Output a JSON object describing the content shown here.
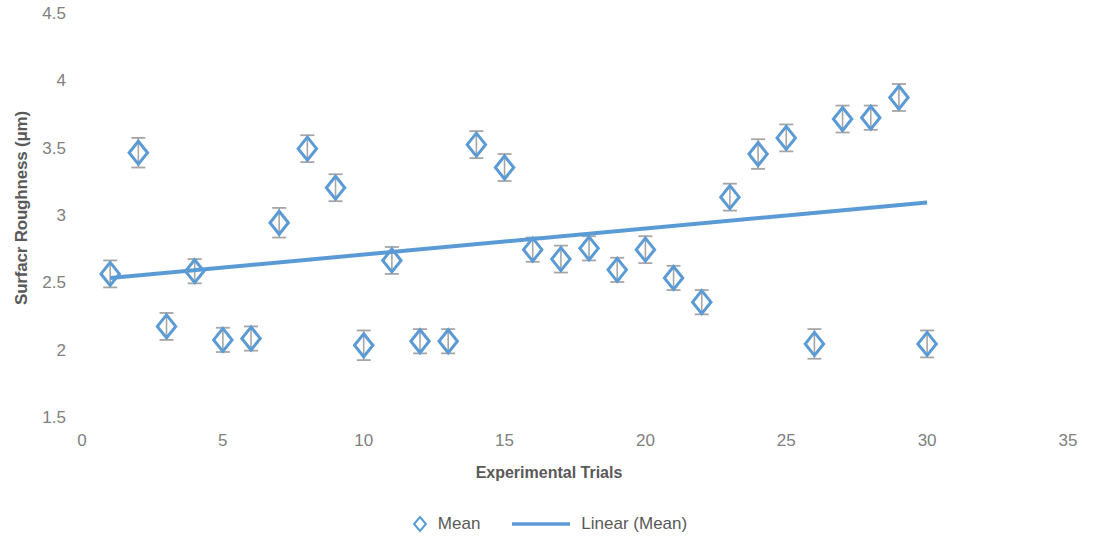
{
  "chart_data": {
    "type": "scatter",
    "title": "",
    "xlabel": "Experimental Trials",
    "ylabel": "Surfacr Roughness (μm)",
    "xlim": [
      0,
      35
    ],
    "ylim": [
      1.5,
      4.5
    ],
    "xticks": [
      "0",
      "5",
      "10",
      "15",
      "20",
      "25",
      "30",
      "35"
    ],
    "yticks": [
      "1.5",
      "2",
      "2.5",
      "3",
      "3.5",
      "4",
      "4.5"
    ],
    "grid": false,
    "legend_position": "bottom",
    "marker": "diamond-open",
    "error_bars": true,
    "series": [
      {
        "name": "Mean",
        "x": [
          1,
          2,
          3,
          4,
          5,
          6,
          7,
          8,
          9,
          10,
          11,
          12,
          13,
          14,
          15,
          16,
          17,
          18,
          19,
          20,
          21,
          22,
          23,
          24,
          25,
          26,
          27,
          28,
          29,
          30
        ],
        "values": [
          2.57,
          3.47,
          2.18,
          2.59,
          2.08,
          2.09,
          2.95,
          3.5,
          3.21,
          2.04,
          2.67,
          2.07,
          2.07,
          3.53,
          3.36,
          2.75,
          2.68,
          2.76,
          2.6,
          2.75,
          2.54,
          2.36,
          3.14,
          3.46,
          3.58,
          2.05,
          3.72,
          3.73,
          3.88,
          2.05
        ],
        "errors": [
          0.1,
          0.11,
          0.1,
          0.09,
          0.09,
          0.09,
          0.11,
          0.1,
          0.1,
          0.11,
          0.1,
          0.09,
          0.09,
          0.1,
          0.1,
          0.09,
          0.1,
          0.09,
          0.09,
          0.1,
          0.09,
          0.09,
          0.1,
          0.11,
          0.1,
          0.11,
          0.1,
          0.09,
          0.1,
          0.1
        ]
      }
    ],
    "trendline": {
      "name": "Linear (Mean)",
      "x_start": 1,
      "y_start": 2.54,
      "x_end": 30,
      "y_end": 3.1
    },
    "legend_entries": [
      {
        "label": "Mean",
        "kind": "marker"
      },
      {
        "label": "Linear (Mean)",
        "kind": "line"
      }
    ],
    "colors": {
      "series": "#5B9BD5",
      "trendline": "#5B9BD5",
      "error_bar": "#A6A6A6",
      "tick_text": "#808080",
      "axis_title": "#595959"
    }
  }
}
